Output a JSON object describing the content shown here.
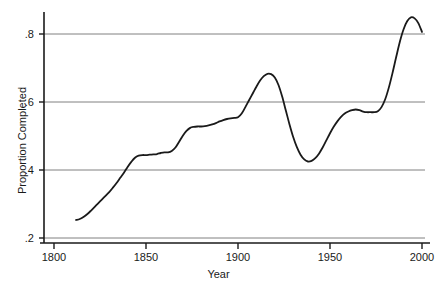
{
  "chart_data": {
    "type": "line",
    "title": "",
    "xlabel": "Year",
    "ylabel": "Proportion Completed",
    "xlim": [
      1786,
      2005
    ],
    "ylim": [
      0.195,
      0.87
    ],
    "xticks": [
      1800,
      1850,
      1900,
      1950,
      2000
    ],
    "xtick_labels": [
      "1800",
      "1850",
      "1900",
      "1950",
      "2000"
    ],
    "yticks": [
      0.2,
      0.4,
      0.6,
      0.8
    ],
    "ytick_labels": [
      ".2",
      ".4",
      ".6",
      ".8"
    ],
    "grid": "horizontal",
    "grid_color": "#808080",
    "line_color": "#1a1a1a",
    "legend": "none",
    "series": [
      {
        "name": "Proportion Completed",
        "x": [
          1812,
          1814,
          1816,
          1818,
          1820,
          1822,
          1824,
          1826,
          1828,
          1830,
          1832,
          1834,
          1836,
          1838,
          1840,
          1842,
          1844,
          1846,
          1848,
          1850,
          1852,
          1854,
          1856,
          1858,
          1860,
          1862,
          1864,
          1866,
          1868,
          1870,
          1872,
          1874,
          1876,
          1878,
          1880,
          1882,
          1884,
          1886,
          1888,
          1890,
          1892,
          1894,
          1896,
          1898,
          1900,
          1902,
          1904,
          1906,
          1908,
          1910,
          1912,
          1914,
          1916,
          1918,
          1920,
          1922,
          1924,
          1926,
          1928,
          1930,
          1932,
          1934,
          1936,
          1938,
          1940,
          1942,
          1944,
          1946,
          1948,
          1950,
          1952,
          1954,
          1956,
          1958,
          1960,
          1962,
          1964,
          1966,
          1968,
          1970,
          1972,
          1974,
          1976,
          1978,
          1980,
          1982,
          1984,
          1986,
          1988,
          1990,
          1992,
          1994,
          1996,
          1998,
          2000
        ],
        "y": [
          0.253,
          0.256,
          0.262,
          0.27,
          0.28,
          0.291,
          0.302,
          0.313,
          0.324,
          0.335,
          0.348,
          0.362,
          0.377,
          0.392,
          0.409,
          0.424,
          0.436,
          0.442,
          0.444,
          0.444,
          0.445,
          0.446,
          0.447,
          0.45,
          0.452,
          0.452,
          0.456,
          0.466,
          0.483,
          0.501,
          0.515,
          0.524,
          0.527,
          0.528,
          0.528,
          0.529,
          0.531,
          0.534,
          0.538,
          0.543,
          0.547,
          0.55,
          0.552,
          0.553,
          0.555,
          0.566,
          0.585,
          0.605,
          0.625,
          0.645,
          0.663,
          0.676,
          0.683,
          0.682,
          0.672,
          0.65,
          0.616,
          0.575,
          0.534,
          0.497,
          0.467,
          0.445,
          0.431,
          0.425,
          0.427,
          0.435,
          0.448,
          0.466,
          0.487,
          0.508,
          0.527,
          0.543,
          0.556,
          0.566,
          0.572,
          0.576,
          0.578,
          0.576,
          0.572,
          0.57,
          0.57,
          0.57,
          0.573,
          0.585,
          0.608,
          0.643,
          0.686,
          0.733,
          0.778,
          0.814,
          0.838,
          0.849,
          0.846,
          0.832,
          0.806
        ]
      }
    ]
  },
  "axes": {
    "y_title": "Proportion Completed",
    "x_title": "Year"
  }
}
